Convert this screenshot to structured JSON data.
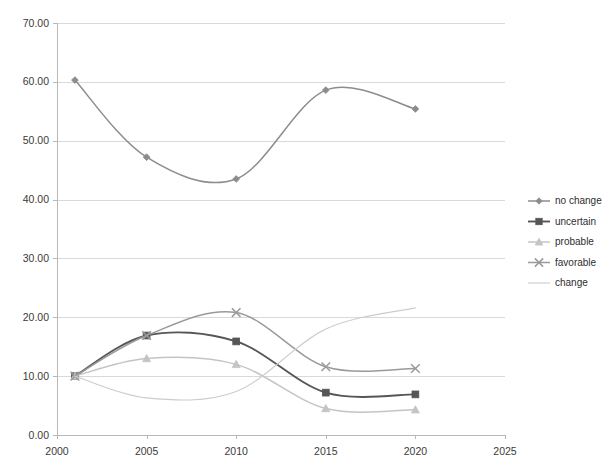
{
  "chart_data": {
    "type": "line",
    "title": "",
    "subtitle": "",
    "xlabel": "",
    "ylabel": "",
    "xlim": [
      2000,
      2025
    ],
    "ylim": [
      0.0,
      70.0
    ],
    "grid": true,
    "legend_position": "right",
    "x_ticks": [
      "2000",
      "2005",
      "2010",
      "2015",
      "2020",
      "2025"
    ],
    "x_tick_values": [
      2000,
      2005,
      2010,
      2015,
      2020,
      2025
    ],
    "y_ticks": [
      "0.00",
      "10.00",
      "20.00",
      "30.00",
      "40.00",
      "50.00",
      "60.00",
      "70.00"
    ],
    "y_tick_values": [
      0,
      10,
      20,
      30,
      40,
      50,
      60,
      70
    ],
    "x": [
      2001,
      2005,
      2010,
      2015,
      2020
    ],
    "series": [
      {
        "name": "no change",
        "marker": "diamond",
        "color": "#8c8c8c",
        "values": [
          60.3,
          47.2,
          43.5,
          58.6,
          55.4
        ]
      },
      {
        "name": "uncertain",
        "marker": "square",
        "color": "#565656",
        "values": [
          10.0,
          16.9,
          15.9,
          7.2,
          6.9
        ]
      },
      {
        "name": "probable",
        "marker": "triangle",
        "color": "#c4c4c4",
        "values": [
          10.0,
          13.0,
          12.0,
          4.5,
          4.3
        ]
      },
      {
        "name": "favorable",
        "marker": "cross",
        "color": "#9a9a9a",
        "values": [
          10.0,
          16.9,
          20.8,
          11.6,
          11.3
        ]
      },
      {
        "name": "change",
        "marker": "none",
        "color": "#cccccc",
        "values": [
          10.0,
          6.3,
          7.4,
          18.0,
          21.6
        ]
      }
    ]
  },
  "legend": {
    "entries": [
      {
        "label": "no change"
      },
      {
        "label": "uncertain"
      },
      {
        "label": "probable"
      },
      {
        "label": "favorable"
      },
      {
        "label": "change"
      }
    ]
  },
  "colors": {
    "gridline": "#d9d9d9",
    "axis": "#b8b8b8",
    "text": "#3a3a3a",
    "background": "#ffffff"
  }
}
